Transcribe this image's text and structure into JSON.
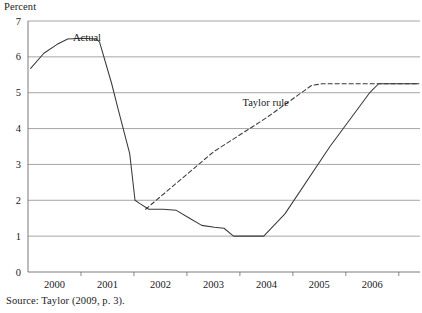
{
  "figure": {
    "unit_label": "Percent",
    "source_note": "Source: Taylor (2009, p. 3)."
  },
  "chart_data": {
    "type": "line",
    "title": "",
    "subtitle": "",
    "xlabel": "",
    "ylabel": "Percent",
    "ylim": [
      0,
      7
    ],
    "xlim": [
      1999.5,
      2006.9
    ],
    "grid": true,
    "grid_axis": "y",
    "legend": "inline-annotations",
    "ytick_labels": [
      "0",
      "1",
      "2",
      "3",
      "4",
      "5",
      "6",
      "7"
    ],
    "ytick_values": [
      0,
      1,
      2,
      3,
      4,
      5,
      6,
      7
    ],
    "xtick_labels": [
      "2000",
      "2001",
      "2002",
      "2003",
      "2004",
      "2005",
      "2006"
    ],
    "xtick_values": [
      2000,
      2001,
      2002,
      2003,
      2004,
      2005,
      2006
    ],
    "annotations": [
      {
        "text": "Actual",
        "x": 2000.35,
        "y": 6.45
      },
      {
        "text": "Taylor rule",
        "x": 2003.55,
        "y": 4.62
      }
    ],
    "series": [
      {
        "name": "Actual",
        "style": "solid",
        "color": "#3a3a3a",
        "points": [
          {
            "x": 1999.55,
            "y": 5.68
          },
          {
            "x": 1999.8,
            "y": 6.1
          },
          {
            "x": 2000.05,
            "y": 6.35
          },
          {
            "x": 2000.25,
            "y": 6.5
          },
          {
            "x": 2000.52,
            "y": 6.52
          },
          {
            "x": 2000.78,
            "y": 6.5
          },
          {
            "x": 2000.85,
            "y": 6.42
          },
          {
            "x": 2001.08,
            "y": 5.25
          },
          {
            "x": 2001.2,
            "y": 4.55
          },
          {
            "x": 2001.42,
            "y": 3.3
          },
          {
            "x": 2001.52,
            "y": 2.0
          },
          {
            "x": 2001.62,
            "y": 1.9
          },
          {
            "x": 2001.78,
            "y": 1.75
          },
          {
            "x": 2002.05,
            "y": 1.75
          },
          {
            "x": 2002.3,
            "y": 1.72
          },
          {
            "x": 2002.55,
            "y": 1.5
          },
          {
            "x": 2002.78,
            "y": 1.3
          },
          {
            "x": 2003.02,
            "y": 1.25
          },
          {
            "x": 2003.2,
            "y": 1.22
          },
          {
            "x": 2003.38,
            "y": 1.0
          },
          {
            "x": 2003.95,
            "y": 1.0
          },
          {
            "x": 2004.35,
            "y": 1.62
          },
          {
            "x": 2005.2,
            "y": 3.5
          },
          {
            "x": 2005.95,
            "y": 5.0
          },
          {
            "x": 2006.12,
            "y": 5.25
          },
          {
            "x": 2006.88,
            "y": 5.25
          }
        ]
      },
      {
        "name": "Taylor rule",
        "style": "dashed",
        "color": "#3a3a3a",
        "points": [
          {
            "x": 2001.72,
            "y": 1.75
          },
          {
            "x": 2002.2,
            "y": 2.35
          },
          {
            "x": 2003.0,
            "y": 3.35
          },
          {
            "x": 2004.0,
            "y": 4.3
          },
          {
            "x": 2004.85,
            "y": 5.2
          },
          {
            "x": 2005.05,
            "y": 5.25
          },
          {
            "x": 2006.88,
            "y": 5.25
          }
        ]
      }
    ]
  }
}
